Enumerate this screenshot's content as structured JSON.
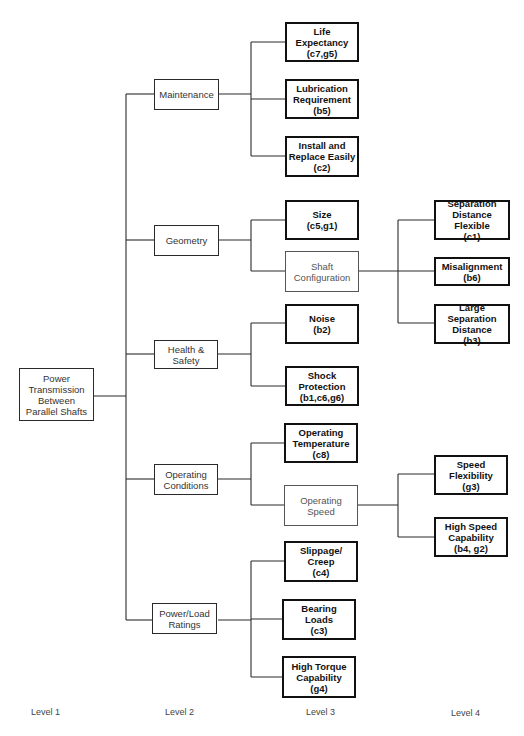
{
  "diagram": {
    "root": {
      "label": "Power\nTransmission\nBetween\nParallel Shafts"
    },
    "level2": [
      {
        "label": "Maintenance"
      },
      {
        "label": "Geometry"
      },
      {
        "label": "Health &\nSafety"
      },
      {
        "label": "Operating\nConditions"
      },
      {
        "label": "Power/Load\nRatings"
      }
    ],
    "level3": [
      {
        "label": "Life\nExpectancy\n(c7,g5)",
        "parent": "Maintenance"
      },
      {
        "label": "Lubrication\nRequirement\n(b5)",
        "parent": "Maintenance"
      },
      {
        "label": "Install and\nReplace Easily\n(c2)",
        "parent": "Maintenance"
      },
      {
        "label": "Size\n(c5,g1)",
        "parent": "Geometry"
      },
      {
        "label": "Shaft\nConfiguration",
        "parent": "Geometry"
      },
      {
        "label": "Noise\n(b2)",
        "parent": "Health & Safety"
      },
      {
        "label": "Shock\nProtection\n(b1,c6,g6)",
        "parent": "Health & Safety"
      },
      {
        "label": "Operating\nTemperature\n(c8)",
        "parent": "Operating Conditions"
      },
      {
        "label": "Operating\nSpeed",
        "parent": "Operating Conditions"
      },
      {
        "label": "Slippage/\nCreep\n(c4)",
        "parent": "Power/Load Ratings"
      },
      {
        "label": "Bearing\nLoads\n(c3)",
        "parent": "Power/Load Ratings"
      },
      {
        "label": "High Torque\nCapability\n(g4)",
        "parent": "Power/Load Ratings"
      }
    ],
    "level4": [
      {
        "label": "Separation\nDistance Flexible\n(c1)",
        "parent": "Shaft Configuration"
      },
      {
        "label": "Misalignment\n(b6)",
        "parent": "Shaft Configuration"
      },
      {
        "label": "Large Separation\nDistance\n(b3)",
        "parent": "Shaft Configuration"
      },
      {
        "label": "Speed\nFlexibility\n(g3)",
        "parent": "Operating Speed"
      },
      {
        "label": "High Speed\nCapability\n(b4, g2)",
        "parent": "Operating Speed"
      }
    ],
    "level_labels": [
      "Level 1",
      "Level 2",
      "Level 3",
      "Level 4"
    ]
  }
}
